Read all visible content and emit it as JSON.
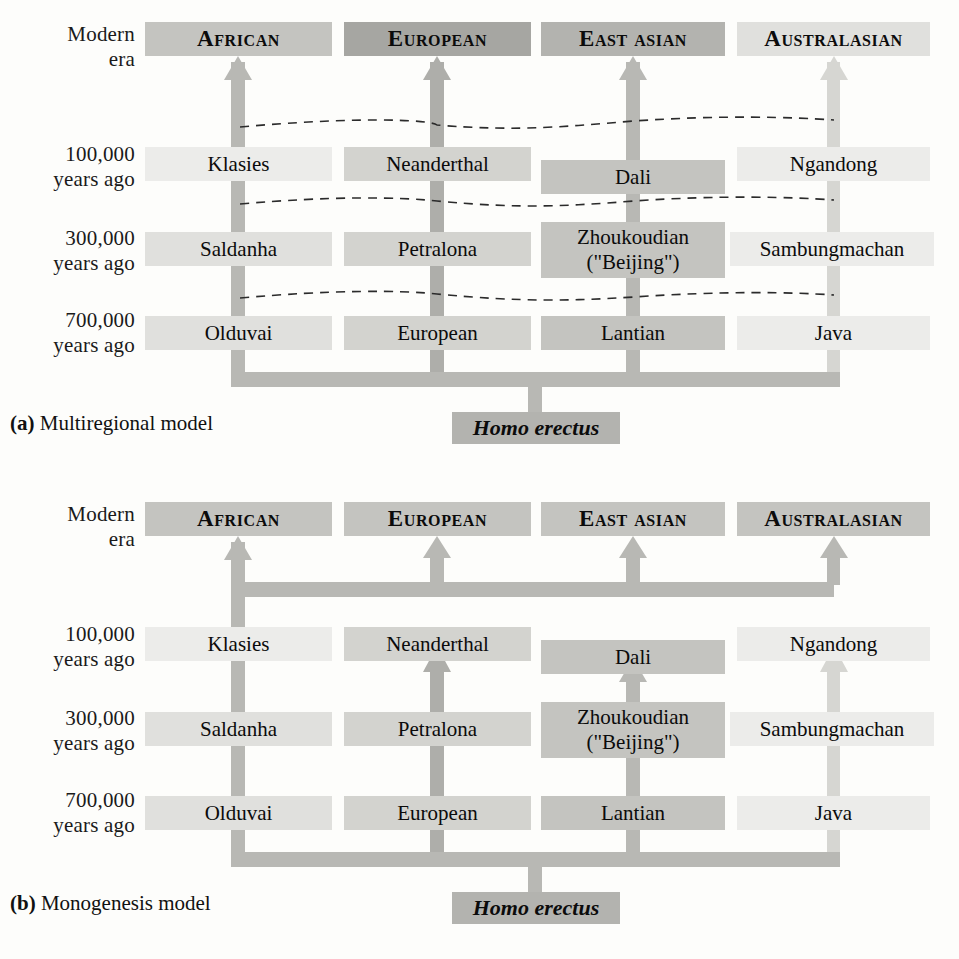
{
  "figure": {
    "colors": {
      "lightest": "#ececea",
      "light": "#e0e0dd",
      "medium_light": "#d3d3cf",
      "medium": "#c4c4c0",
      "medium_dark": "#b3b3af",
      "dark": "#a6a6a2",
      "connector": "#b8b8b4",
      "text": "#111111"
    },
    "time_labels": [
      {
        "line1": "Modern",
        "line2": "era"
      },
      {
        "line1": "100,000",
        "line2": "years ago"
      },
      {
        "line1": "300,000",
        "line2": "years ago"
      },
      {
        "line1": "700,000",
        "line2": "years ago"
      }
    ],
    "columns": [
      "African",
      "European",
      "East asian",
      "Australasian"
    ],
    "root_label": "Homo erectus"
  },
  "panel_a": {
    "caption_tag": "(a)",
    "caption_text": "Multiregional model",
    "modern": [
      {
        "label": "African",
        "shade": "sh-4"
      },
      {
        "label": "European",
        "shade": "sh-6"
      },
      {
        "label": "East asian",
        "shade": "sh-5"
      },
      {
        "label": "Australasian",
        "shade": "sh-2"
      }
    ],
    "row_100k": [
      {
        "label": "Klasies",
        "shade": "sh-1"
      },
      {
        "label": "Neanderthal",
        "shade": "sh-3"
      },
      {
        "label": "Dali",
        "shade": "sh-4"
      },
      {
        "label": "Ngandong",
        "shade": "sh-1"
      }
    ],
    "row_300k": [
      {
        "label": "Saldanha",
        "shade": "sh-2"
      },
      {
        "label": "Petralona",
        "shade": "sh-3"
      },
      {
        "label": "Zhoukoudian\n(\"Beijing\")",
        "line1": "Zhoukoudian",
        "line2": "(\"Beijing\")",
        "shade": "sh-4"
      },
      {
        "label": "Sambungmachan",
        "shade": "sh-1"
      }
    ],
    "row_700k": [
      {
        "label": "Olduvai",
        "shade": "sh-2"
      },
      {
        "label": "European",
        "shade": "sh-3"
      },
      {
        "label": "Lantian",
        "shade": "sh-4"
      },
      {
        "label": "Java",
        "shade": "sh-1"
      }
    ],
    "root_label": "Homo erectus",
    "gene_flow_lines": 3
  },
  "panel_b": {
    "caption_tag": "(b)",
    "caption_text": "Monogenesis model",
    "modern": [
      {
        "label": "African",
        "shade": "sh-4"
      },
      {
        "label": "European",
        "shade": "sh-4"
      },
      {
        "label": "East asian",
        "shade": "sh-4"
      },
      {
        "label": "Australasian",
        "shade": "sh-4"
      }
    ],
    "row_100k": [
      {
        "label": "Klasies",
        "shade": "sh-1"
      },
      {
        "label": "Neanderthal",
        "shade": "sh-3"
      },
      {
        "label": "Dali",
        "shade": "sh-4"
      },
      {
        "label": "Ngandong",
        "shade": "sh-1"
      }
    ],
    "row_300k": [
      {
        "label": "Saldanha",
        "shade": "sh-2"
      },
      {
        "label": "Petralona",
        "shade": "sh-3"
      },
      {
        "label": "Zhoukoudian\n(\"Beijing\")",
        "line1": "Zhoukoudian",
        "line2": "(\"Beijing\")",
        "shade": "sh-4"
      },
      {
        "label": "Sambungmachan",
        "shade": "sh-1"
      }
    ],
    "row_700k": [
      {
        "label": "Olduvai",
        "shade": "sh-2"
      },
      {
        "label": "European",
        "shade": "sh-3"
      },
      {
        "label": "Lantian",
        "shade": "sh-4"
      },
      {
        "label": "Java",
        "shade": "sh-1"
      }
    ],
    "root_label": "Homo erectus",
    "gene_flow_lines": 0
  }
}
